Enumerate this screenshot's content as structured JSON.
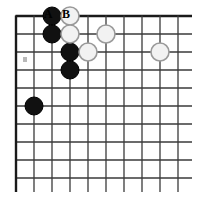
{
  "figure": {
    "kind": "go-board-diagram",
    "board": {
      "columns": 10,
      "rows": 10,
      "origin_x": 16,
      "origin_y": 16,
      "spacing": 18,
      "edge_line_width": 2.4,
      "inner_line_width": 1.3,
      "line_color": "#3a3a3a",
      "edge_color": "#1a1a1a",
      "background_color": "#ffffff",
      "overhang": 14
    },
    "stone_style": {
      "radius": 9,
      "black_fill": "#111111",
      "black_stroke": "#000000",
      "white_fill": "#f2f2f2",
      "white_stroke": "#9a9a9a",
      "white_stroke_width": 1.6
    },
    "stones": [
      {
        "color": "black",
        "col": 3,
        "row": 1,
        "label": "black-stone-c1"
      },
      {
        "color": "black",
        "col": 3,
        "row": 2,
        "label": "black-stone-c2"
      },
      {
        "color": "black",
        "col": 4,
        "row": 3,
        "label": "black-stone-d3"
      },
      {
        "color": "black",
        "col": 4,
        "row": 4,
        "label": "black-stone-d4"
      },
      {
        "color": "black",
        "col": 2,
        "row": 6,
        "label": "black-stone-b6"
      },
      {
        "color": "white",
        "col": 4,
        "row": 1,
        "label": "white-stone-d1"
      },
      {
        "color": "white",
        "col": 4,
        "row": 2,
        "label": "white-stone-d2"
      },
      {
        "color": "white",
        "col": 6,
        "row": 2,
        "label": "white-stone-f2"
      },
      {
        "color": "white",
        "col": 5,
        "row": 3,
        "label": "white-stone-e3"
      },
      {
        "color": "white",
        "col": 9,
        "row": 3,
        "label": "white-stone-i3"
      }
    ],
    "point_labels": [
      {
        "text": "A",
        "col": 3,
        "x": 48,
        "y": 8
      },
      {
        "text": "B",
        "col": 4,
        "x": 66,
        "y": 8
      }
    ],
    "marks": [
      {
        "kind": "smudge",
        "x": 23,
        "y": 57,
        "width": 4,
        "height": 5,
        "color": "#b9b9b9"
      }
    ]
  }
}
